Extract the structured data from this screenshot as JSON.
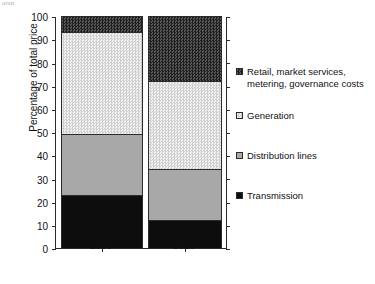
{
  "artifact": {
    "top_left_text": "unur."
  },
  "chart_data": {
    "type": "bar",
    "stacked": true,
    "title": "",
    "xlabel": "",
    "ylabel": "Percentage of total price",
    "ylim": [
      0,
      100
    ],
    "yticks": [
      0,
      10,
      20,
      30,
      40,
      50,
      60,
      70,
      80,
      90,
      100
    ],
    "categories": [
      "1990",
      "2010"
    ],
    "grid": false,
    "legend_position": "right",
    "series": [
      {
        "name": "Transmission",
        "values": [
          23,
          12
        ],
        "cumulative_top": [
          23,
          12
        ],
        "fill": "solid-black",
        "color": "#0d0d0d"
      },
      {
        "name": "Distribution lines",
        "values": [
          26,
          22
        ],
        "cumulative_top": [
          49,
          34
        ],
        "fill": "solid-gray",
        "color": "#a8a8a8"
      },
      {
        "name": "Generation",
        "values": [
          44,
          38
        ],
        "cumulative_top": [
          93,
          72
        ],
        "fill": "light-checker",
        "color": "#d4d4d4"
      },
      {
        "name": "Retail, market services, metering, governance costs",
        "values": [
          7,
          28
        ],
        "cumulative_top": [
          100,
          100
        ],
        "fill": "dark-checker",
        "color": "#3a3a3a"
      }
    ],
    "legend_order": [
      "Retail, market services, metering, governance costs",
      "Generation",
      "Distribution lines",
      "Transmission"
    ]
  }
}
